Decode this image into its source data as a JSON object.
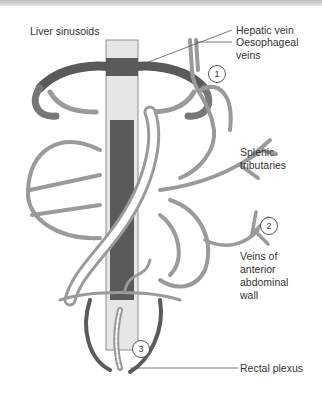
{
  "diagram": {
    "labels": {
      "liver_sinusoids": "Liver sinusoids",
      "hepatic_vein": "Hepatic vein",
      "oesophageal_veins_1": "Oesophageal",
      "oesophageal_veins_2": "veins",
      "splenic_1": "Splenic",
      "splenic_2": "tributaries",
      "abdominal_1": "Veins of",
      "abdominal_2": "anterior",
      "abdominal_3": "abdominal",
      "abdominal_4": "wall",
      "rectal_plexus": "Rectal plexus"
    },
    "markers": [
      "1",
      "2",
      "3"
    ],
    "colors": {
      "portal_vein": "#9a9a9a",
      "systemic_vein": "#5a5a5a",
      "leader_line": "#555555",
      "background": "#ffffff"
    }
  }
}
